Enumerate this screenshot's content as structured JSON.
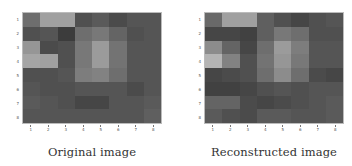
{
  "chart_data": [
    {
      "type": "heatmap",
      "title": "Original image",
      "colormap": "gray",
      "rows": 8,
      "cols": 8,
      "x_ticks": [
        "1",
        "2",
        "3",
        "4",
        "5",
        "6",
        "7",
        "8"
      ],
      "y_ticks": [
        "1",
        "2",
        "3",
        "4",
        "5",
        "6",
        "7",
        "8"
      ],
      "values": [
        [
          110,
          160,
          160,
          80,
          90,
          75,
          85,
          85
        ],
        [
          80,
          85,
          60,
          110,
          120,
          100,
          80,
          85
        ],
        [
          150,
          75,
          80,
          120,
          155,
          115,
          85,
          85
        ],
        [
          165,
          160,
          80,
          120,
          155,
          115,
          85,
          85
        ],
        [
          80,
          80,
          85,
          125,
          130,
          110,
          85,
          85
        ],
        [
          85,
          80,
          80,
          85,
          85,
          85,
          75,
          85
        ],
        [
          90,
          85,
          80,
          70,
          70,
          85,
          85,
          90
        ],
        [
          85,
          85,
          85,
          85,
          85,
          85,
          85,
          95
        ]
      ],
      "value_range": [
        0,
        255
      ],
      "grid": false
    },
    {
      "type": "heatmap",
      "title": "Reconstructed image",
      "colormap": "gray",
      "rows": 8,
      "cols": 8,
      "x_ticks": [
        "1",
        "2",
        "3",
        "4",
        "5",
        "6",
        "7",
        "8"
      ],
      "y_ticks": [
        "1",
        "2",
        "3",
        "4",
        "5",
        "6",
        "7",
        "8"
      ],
      "values": [
        [
          105,
          160,
          160,
          95,
          80,
          70,
          80,
          85
        ],
        [
          70,
          70,
          65,
          95,
          120,
          110,
          80,
          80
        ],
        [
          140,
          100,
          70,
          110,
          155,
          125,
          85,
          85
        ],
        [
          180,
          130,
          80,
          115,
          150,
          120,
          85,
          85
        ],
        [
          70,
          75,
          80,
          110,
          140,
          110,
          75,
          70
        ],
        [
          65,
          65,
          70,
          80,
          85,
          80,
          85,
          85
        ],
        [
          100,
          100,
          75,
          70,
          75,
          80,
          85,
          90
        ],
        [
          90,
          80,
          75,
          90,
          90,
          85,
          85,
          90
        ]
      ],
      "value_range": [
        0,
        255
      ],
      "grid": false
    }
  ],
  "panels": [
    {
      "caption": "Original image"
    },
    {
      "caption": "Reconstructed image"
    }
  ]
}
